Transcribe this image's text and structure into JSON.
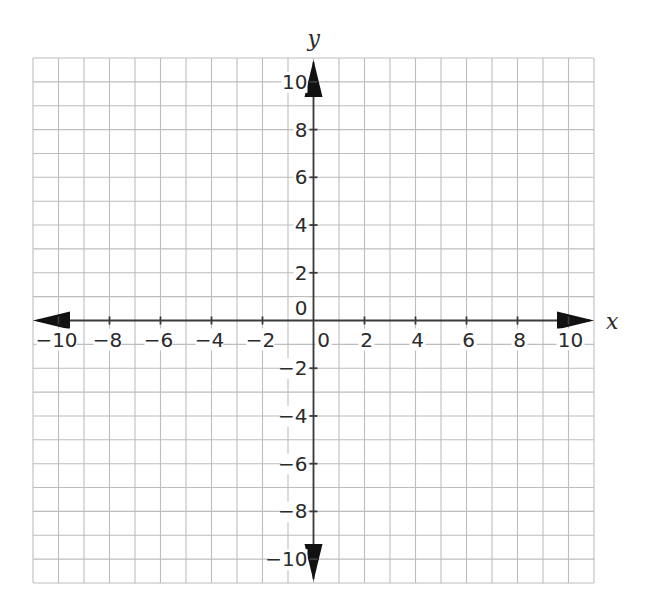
{
  "chart_data": {
    "type": "scatter",
    "title": "",
    "subtitle": "",
    "xlabel": "x",
    "ylabel": "y",
    "xlim": [
      -11,
      11
    ],
    "ylim": [
      -11,
      11
    ],
    "grid": true,
    "grid_step": 1,
    "legend": null,
    "x_ticks": [
      -10,
      -8,
      -6,
      -4,
      -2,
      0,
      2,
      4,
      6,
      8,
      10
    ],
    "y_ticks": [
      -10,
      -8,
      -6,
      -4,
      -2,
      0,
      2,
      4,
      6,
      8,
      10
    ],
    "x_tick_labels": [
      "−10",
      "−8",
      "−6",
      "−4",
      "−2",
      "0",
      "2",
      "4",
      "6",
      "8",
      "10"
    ],
    "y_tick_labels": [
      "−10",
      "−8",
      "−6",
      "−4",
      "−2",
      "0",
      "2",
      "4",
      "6",
      "8",
      "10"
    ],
    "series": [],
    "axis_arrows": true
  },
  "colors": {
    "grid": "#bdbdbd",
    "axis": "#3a3a3a",
    "arrow": "#111111",
    "text": "#2a2a2a",
    "background": "#ffffff"
  },
  "layout": {
    "grid_left": 33,
    "grid_right": 594,
    "grid_top": 58,
    "grid_bottom": 583,
    "cells_x": 22,
    "cells_y": 22
  }
}
